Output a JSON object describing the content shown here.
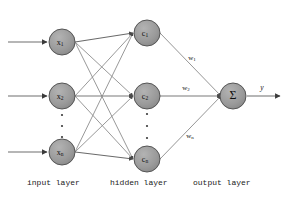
{
  "diagram": {
    "type": "neural-network",
    "colors": {
      "node_fill": "#9a9a9a",
      "node_stroke": "#4a4a4a",
      "edge": "#7a7a7a",
      "strong_edge": "#5a5a5a",
      "text": "#111111",
      "background": "#ffffff"
    },
    "input_layer": {
      "caption": "input layer",
      "nodes": [
        {
          "id": "x1",
          "base": "x",
          "sub": "1",
          "cx": 62,
          "cy": 42,
          "r": 13
        },
        {
          "id": "x2",
          "base": "x",
          "sub": "2",
          "cx": 62,
          "cy": 96,
          "r": 13
        },
        {
          "id": "xn",
          "base": "x",
          "sub": "n",
          "cx": 62,
          "cy": 152,
          "r": 13
        }
      ],
      "ellipsis": [
        {
          "cx": 62,
          "cy": 115
        },
        {
          "cx": 62,
          "cy": 126
        },
        {
          "cx": 62,
          "cy": 137
        }
      ],
      "incoming_arrows": [
        {
          "x1": 8,
          "y1": 42,
          "x2": 46,
          "y2": 42
        },
        {
          "x1": 8,
          "y1": 96,
          "x2": 46,
          "y2": 96
        },
        {
          "x1": 8,
          "y1": 152,
          "x2": 46,
          "y2": 152
        }
      ]
    },
    "hidden_layer": {
      "caption": "hidden layer",
      "nodes": [
        {
          "id": "c1",
          "base": "c",
          "sub": "1",
          "cx": 147,
          "cy": 33,
          "r": 13
        },
        {
          "id": "c2",
          "base": "c",
          "sub": "2",
          "cx": 147,
          "cy": 96,
          "r": 13
        },
        {
          "id": "cn",
          "base": "c",
          "sub": "n",
          "cx": 147,
          "cy": 159,
          "r": 13
        }
      ],
      "ellipsis": [
        {
          "cx": 147,
          "cy": 114
        },
        {
          "cx": 147,
          "cy": 126
        },
        {
          "cx": 147,
          "cy": 138
        }
      ]
    },
    "output_layer": {
      "caption": "output layer",
      "node": {
        "id": "sum",
        "symbol": "Σ",
        "cx": 233,
        "cy": 96,
        "r": 13
      },
      "output_arrow": {
        "x1": 246,
        "y1": 96,
        "x2": 281,
        "y2": 96
      },
      "output_label": {
        "text": "y",
        "x": 262,
        "y": 88
      }
    },
    "weights": [
      {
        "id": "w1",
        "base": "w",
        "sub": "1",
        "x": 192,
        "y": 58
      },
      {
        "id": "w2",
        "base": "w",
        "sub": "2",
        "x": 186,
        "y": 88
      },
      {
        "id": "wn",
        "base": "w",
        "sub": "n",
        "x": 190,
        "y": 136
      }
    ],
    "connections_input_to_hidden": [
      {
        "from": "x1",
        "to": "c1"
      },
      {
        "from": "x1",
        "to": "c2"
      },
      {
        "from": "x1",
        "to": "cn"
      },
      {
        "from": "x2",
        "to": "c1"
      },
      {
        "from": "x2",
        "to": "c2"
      },
      {
        "from": "x2",
        "to": "cn"
      },
      {
        "from": "xn",
        "to": "c1"
      },
      {
        "from": "xn",
        "to": "c2"
      },
      {
        "from": "xn",
        "to": "cn"
      }
    ],
    "connections_hidden_to_output": [
      {
        "from": "c1",
        "to": "sum",
        "weight": "w1"
      },
      {
        "from": "c2",
        "to": "sum",
        "weight": "w2"
      },
      {
        "from": "cn",
        "to": "sum",
        "weight": "wn"
      }
    ]
  }
}
